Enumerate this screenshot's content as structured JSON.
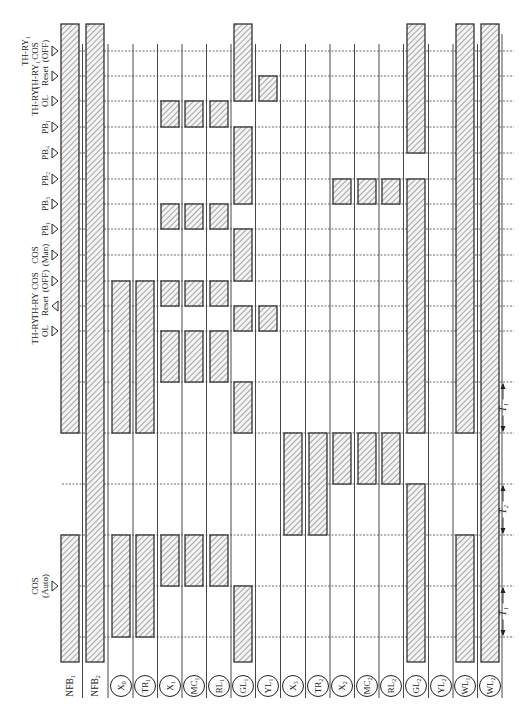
{
  "diagram": {
    "type": "timing-sequence",
    "orientation": "rotated-90",
    "hatch_color": "#6f6f6f",
    "line_color": "#222222",
    "dash_color": "#444444"
  },
  "columns": [
    {
      "id": "NFB1",
      "label": "NFB",
      "sub": "1",
      "circled": false,
      "x": 70
    },
    {
      "id": "NFB2",
      "label": "NFB",
      "sub": "2",
      "circled": false,
      "x": 95
    },
    {
      "id": "X0",
      "label": "X",
      "sub": "0",
      "circled": true,
      "x": 121
    },
    {
      "id": "TR1",
      "label": "TR",
      "sub": "1",
      "circled": true,
      "x": 145
    },
    {
      "id": "X1",
      "label": "X",
      "sub": "1",
      "circled": true,
      "x": 170
    },
    {
      "id": "MC1",
      "label": "MC",
      "sub": "1",
      "circled": true,
      "x": 194
    },
    {
      "id": "RL1",
      "label": "RL",
      "sub": "1",
      "circled": true,
      "x": 219
    },
    {
      "id": "GL1",
      "label": "GL",
      "sub": "1",
      "circled": true,
      "x": 243
    },
    {
      "id": "YL1",
      "label": "YL",
      "sub": "1",
      "circled": true,
      "x": 268
    },
    {
      "id": "X3",
      "label": "X",
      "sub": "3",
      "circled": true,
      "x": 293
    },
    {
      "id": "TR2",
      "label": "TR",
      "sub": "2",
      "circled": true,
      "x": 318
    },
    {
      "id": "X2",
      "label": "X",
      "sub": "2",
      "circled": true,
      "x": 342
    },
    {
      "id": "MC2",
      "label": "MC",
      "sub": "2",
      "circled": true,
      "x": 367
    },
    {
      "id": "RL2",
      "label": "RL",
      "sub": "2",
      "circled": true,
      "x": 391
    },
    {
      "id": "GL2",
      "label": "GL",
      "sub": "2",
      "circled": true,
      "x": 416
    },
    {
      "id": "YL2",
      "label": "YL",
      "sub": "2",
      "circled": true,
      "x": 441
    },
    {
      "id": "WL1",
      "label": "WL",
      "sub": "1",
      "circled": true,
      "x": 465
    },
    {
      "id": "WL2",
      "label": "WL",
      "sub": "2",
      "circled": true,
      "x": 490
    }
  ],
  "events": [
    {
      "y": 51,
      "lines": [
        "TH-RY₁",
        "COS",
        "(OFF)"
      ],
      "label": "TH-RY1 COS (OFF)",
      "dir": "right"
    },
    {
      "y": 76,
      "lines": [
        "TH-RY₁",
        "Reset"
      ],
      "label": "TH-RY1 Reset",
      "dir": "right"
    },
    {
      "y": 101,
      "lines": [
        "TH-RY₁",
        "OL"
      ],
      "label": "TH-RY1 OL",
      "dir": "right"
    },
    {
      "y": 127,
      "lines": [
        "PB₁"
      ],
      "label": "PB1",
      "dir": "right"
    },
    {
      "y": 153,
      "lines": [
        "PB₄"
      ],
      "label": "PB4",
      "dir": "right"
    },
    {
      "y": 179,
      "lines": [
        "PB₂"
      ],
      "label": "PB2",
      "dir": "right"
    },
    {
      "y": 204,
      "lines": [
        "PB₃"
      ],
      "label": "PB3",
      "dir": "right"
    },
    {
      "y": 229,
      "lines": [
        "PB₁"
      ],
      "label": "PB1",
      "dir": "right"
    },
    {
      "y": 255,
      "lines": [
        "COS",
        "(Man)"
      ],
      "label": "COS (Man)",
      "dir": "right"
    },
    {
      "y": 281,
      "lines": [
        "COS",
        "(OFF)"
      ],
      "label": "COS (OFF)",
      "dir": "right"
    },
    {
      "y": 306,
      "lines": [
        "TH-RY",
        "Reset"
      ],
      "label": "TH-RY Reset",
      "dir": "left"
    },
    {
      "y": 331,
      "lines": [
        "TH-RY",
        "OL"
      ],
      "label": "TH-RY OL",
      "dir": "right"
    },
    {
      "y": 586,
      "lines": [
        "COS",
        "(Auto)"
      ],
      "label": "COS (Auto)",
      "dir": "right"
    }
  ],
  "grid_rows": [
    51,
    76,
    101,
    127,
    153,
    179,
    204,
    229,
    255,
    281,
    306,
    331,
    382,
    433,
    484,
    535,
    586,
    637
  ],
  "intervals": [
    {
      "label": "T₁",
      "text": "T1",
      "y1": 382,
      "y2": 433
    },
    {
      "label": "T₂",
      "text": "T2",
      "y1": 484,
      "y2": 535
    },
    {
      "label": "T₁",
      "text": "T1",
      "y1": 586,
      "y2": 637
    }
  ],
  "bars": [
    {
      "col": "NFB1",
      "y1": 24,
      "y2": 433
    },
    {
      "col": "NFB1",
      "y1": 535,
      "y2": 662
    },
    {
      "col": "NFB2",
      "y1": 24,
      "y2": 662
    },
    {
      "col": "X0",
      "y1": 281,
      "y2": 433
    },
    {
      "col": "X0",
      "y1": 535,
      "y2": 637
    },
    {
      "col": "TR1",
      "y1": 281,
      "y2": 433
    },
    {
      "col": "TR1",
      "y1": 535,
      "y2": 637
    },
    {
      "col": "X1",
      "y1": 101,
      "y2": 127
    },
    {
      "col": "X1",
      "y1": 204,
      "y2": 229
    },
    {
      "col": "X1",
      "y1": 281,
      "y2": 306
    },
    {
      "col": "X1",
      "y1": 331,
      "y2": 382
    },
    {
      "col": "X1",
      "y1": 535,
      "y2": 586
    },
    {
      "col": "MC1",
      "y1": 101,
      "y2": 127
    },
    {
      "col": "MC1",
      "y1": 204,
      "y2": 229
    },
    {
      "col": "MC1",
      "y1": 281,
      "y2": 306
    },
    {
      "col": "MC1",
      "y1": 331,
      "y2": 382
    },
    {
      "col": "MC1",
      "y1": 535,
      "y2": 586
    },
    {
      "col": "RL1",
      "y1": 101,
      "y2": 127
    },
    {
      "col": "RL1",
      "y1": 204,
      "y2": 229
    },
    {
      "col": "RL1",
      "y1": 281,
      "y2": 306
    },
    {
      "col": "RL1",
      "y1": 331,
      "y2": 382
    },
    {
      "col": "RL1",
      "y1": 535,
      "y2": 586
    },
    {
      "col": "GL1",
      "y1": 24,
      "y2": 101
    },
    {
      "col": "GL1",
      "y1": 127,
      "y2": 204
    },
    {
      "col": "GL1",
      "y1": 229,
      "y2": 281
    },
    {
      "col": "GL1",
      "y1": 306,
      "y2": 331
    },
    {
      "col": "GL1",
      "y1": 382,
      "y2": 433
    },
    {
      "col": "GL1",
      "y1": 586,
      "y2": 662
    },
    {
      "col": "YL1",
      "y1": 76,
      "y2": 101
    },
    {
      "col": "YL1",
      "y1": 306,
      "y2": 331
    },
    {
      "col": "X3",
      "y1": 433,
      "y2": 535
    },
    {
      "col": "TR2",
      "y1": 433,
      "y2": 535
    },
    {
      "col": "X2",
      "y1": 179,
      "y2": 204
    },
    {
      "col": "X2",
      "y1": 433,
      "y2": 484
    },
    {
      "col": "MC2",
      "y1": 179,
      "y2": 204
    },
    {
      "col": "MC2",
      "y1": 433,
      "y2": 484
    },
    {
      "col": "RL2",
      "y1": 179,
      "y2": 204
    },
    {
      "col": "RL2",
      "y1": 433,
      "y2": 484
    },
    {
      "col": "GL2",
      "y1": 24,
      "y2": 153
    },
    {
      "col": "GL2",
      "y1": 179,
      "y2": 433
    },
    {
      "col": "GL2",
      "y1": 484,
      "y2": 662
    },
    {
      "col": "WL1",
      "y1": 24,
      "y2": 433
    },
    {
      "col": "WL1",
      "y1": 535,
      "y2": 662
    },
    {
      "col": "WL2",
      "y1": 24,
      "y2": 662
    }
  ],
  "layout": {
    "bar_width": 18,
    "grid_left": 62,
    "grid_right": 500,
    "col_line_top": 24,
    "col_line_bottom": 698,
    "label_row_y": 686
  }
}
